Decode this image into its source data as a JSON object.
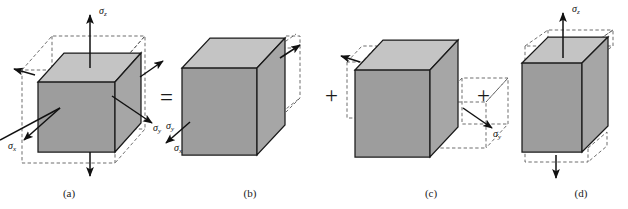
{
  "figure": {
    "background_color": "#ffffff",
    "width": 628,
    "height": 209,
    "colors": {
      "face_front": "#9d9d9d",
      "face_side": "#9d9d9d",
      "face_top": "#c2c2c2",
      "outline": "#1a1a1a",
      "dashed": "#4a4a4a",
      "arrow": "#111111",
      "text": "#1a1a1a"
    }
  },
  "operators": [
    {
      "id": "equals",
      "symbol": "=",
      "x": 160,
      "y": 86
    },
    {
      "id": "plus-1",
      "symbol": "+",
      "x": 325,
      "y": 84
    },
    {
      "id": "plus-2",
      "symbol": "+",
      "x": 477,
      "y": 84
    }
  ],
  "panels": [
    {
      "id": "a",
      "caption": "(a)",
      "caption_x": 49,
      "caption_y": 187,
      "description": "Triaxial stress element with sigma-x, sigma-y and sigma-z acting simultaneously",
      "labels": [
        {
          "id": "a-sigma-z",
          "text": "σ",
          "sub": "z",
          "x": 99,
          "y": 5
        },
        {
          "id": "a-sigma-y",
          "text": "σ",
          "sub": "y",
          "x": 153,
          "y": 122
        },
        {
          "id": "a-sigma-x",
          "text": "σ",
          "sub": "x",
          "x": 8,
          "y": 140
        }
      ]
    },
    {
      "id": "b",
      "caption": "(b)",
      "caption_x": 230,
      "caption_y": 187,
      "description": "Uniaxial stress sigma-x only, element elongates along x and contracts laterally",
      "labels": [
        {
          "id": "b-sigma-y",
          "text": "σ",
          "sub": "y",
          "x": 166,
          "y": 120
        },
        {
          "id": "b-sigma-x",
          "text": "σ",
          "sub": "x",
          "x": 174,
          "y": 142
        }
      ]
    },
    {
      "id": "c",
      "caption": "(c)",
      "caption_x": 411,
      "caption_y": 187,
      "description": "Uniaxial stress sigma-y only, element elongates along y and contracts laterally",
      "labels": [
        {
          "id": "c-sigma-y",
          "text": "σ",
          "sub": "y",
          "x": 493,
          "y": 128
        }
      ]
    },
    {
      "id": "d",
      "caption": "(d)",
      "caption_x": 561,
      "caption_y": 187,
      "description": "Uniaxial stress sigma-z only, element elongates along z and contracts laterally",
      "labels": [
        {
          "id": "d-sigma-z",
          "text": "σ",
          "sub": "z",
          "x": 572,
          "y": 3
        }
      ]
    }
  ]
}
